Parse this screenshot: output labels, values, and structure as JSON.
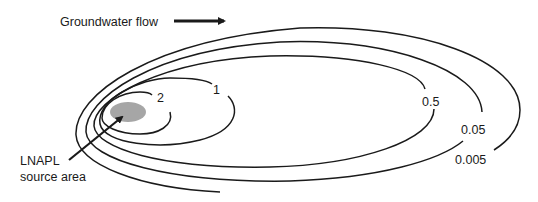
{
  "diagram": {
    "flow_label": "Groundwater flow",
    "source_label_line1": "LNAPL",
    "source_label_line2": "source area",
    "source_color": "#a6a6a6",
    "line_color": "#1a1a1a",
    "contours": [
      {
        "label": "2"
      },
      {
        "label": "1"
      },
      {
        "label": "0.5"
      },
      {
        "label": "0.05"
      },
      {
        "label": "0.005"
      }
    ]
  }
}
